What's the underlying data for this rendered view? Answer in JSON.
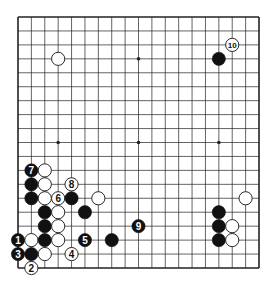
{
  "diagram": {
    "type": "go-board",
    "size": 19,
    "colors": {
      "background": "#ffffff",
      "line": "#222222",
      "black": "#111111",
      "white": "#ffffff"
    },
    "star_points": [
      [
        3,
        3
      ],
      [
        9,
        3
      ],
      [
        15,
        3
      ],
      [
        3,
        9
      ],
      [
        9,
        9
      ],
      [
        15,
        9
      ],
      [
        3,
        15
      ],
      [
        9,
        15
      ],
      [
        15,
        15
      ]
    ],
    "stones": [
      {
        "col": 3,
        "row": 3,
        "color": "white",
        "label": ""
      },
      {
        "col": 15,
        "row": 3,
        "color": "black",
        "label": ""
      },
      {
        "col": 16,
        "row": 2,
        "color": "white",
        "label": "10"
      },
      {
        "col": 1,
        "row": 11,
        "color": "black",
        "label": "7"
      },
      {
        "col": 2,
        "row": 11,
        "color": "white",
        "label": ""
      },
      {
        "col": 1,
        "row": 12,
        "color": "black",
        "label": ""
      },
      {
        "col": 2,
        "row": 12,
        "color": "white",
        "label": ""
      },
      {
        "col": 4,
        "row": 12,
        "color": "white",
        "label": "8"
      },
      {
        "col": 1,
        "row": 13,
        "color": "black",
        "label": ""
      },
      {
        "col": 2,
        "row": 13,
        "color": "white",
        "label": ""
      },
      {
        "col": 3,
        "row": 13,
        "color": "white",
        "label": "6"
      },
      {
        "col": 4,
        "row": 13,
        "color": "black",
        "label": ""
      },
      {
        "col": 6,
        "row": 13,
        "color": "white",
        "label": ""
      },
      {
        "col": 2,
        "row": 14,
        "color": "black",
        "label": ""
      },
      {
        "col": 3,
        "row": 14,
        "color": "white",
        "label": ""
      },
      {
        "col": 5,
        "row": 14,
        "color": "black",
        "label": ""
      },
      {
        "col": 2,
        "row": 15,
        "color": "black",
        "label": ""
      },
      {
        "col": 3,
        "row": 15,
        "color": "white",
        "label": ""
      },
      {
        "col": 9,
        "row": 15,
        "color": "black",
        "label": "9"
      },
      {
        "col": 0,
        "row": 16,
        "color": "black",
        "label": "1"
      },
      {
        "col": 1,
        "row": 16,
        "color": "white",
        "label": ""
      },
      {
        "col": 2,
        "row": 16,
        "color": "black",
        "label": ""
      },
      {
        "col": 3,
        "row": 16,
        "color": "white",
        "label": ""
      },
      {
        "col": 5,
        "row": 16,
        "color": "black",
        "label": "5"
      },
      {
        "col": 7,
        "row": 16,
        "color": "black",
        "label": ""
      },
      {
        "col": 0,
        "row": 17,
        "color": "black",
        "label": "3"
      },
      {
        "col": 1,
        "row": 17,
        "color": "black",
        "label": ""
      },
      {
        "col": 2,
        "row": 17,
        "color": "white",
        "label": ""
      },
      {
        "col": 4,
        "row": 17,
        "color": "white",
        "label": "4"
      },
      {
        "col": 1,
        "row": 18,
        "color": "white",
        "label": "2"
      },
      {
        "col": 17,
        "row": 13,
        "color": "white",
        "label": ""
      },
      {
        "col": 15,
        "row": 14,
        "color": "black",
        "label": ""
      },
      {
        "col": 15,
        "row": 15,
        "color": "black",
        "label": ""
      },
      {
        "col": 16,
        "row": 15,
        "color": "white",
        "label": ""
      },
      {
        "col": 15,
        "row": 16,
        "color": "black",
        "label": ""
      },
      {
        "col": 16,
        "row": 16,
        "color": "white",
        "label": ""
      }
    ]
  }
}
